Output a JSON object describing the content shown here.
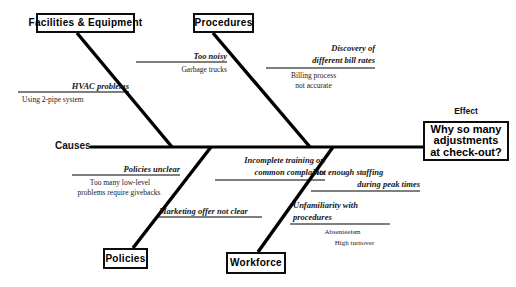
{
  "diagram": {
    "type": "fishbone-ishikawa",
    "causes_label": "Causes",
    "effect_label": "Effect",
    "effect": {
      "text": "Why so many adjustments at check-out?",
      "line1": "Why so many",
      "line2": "adjustments",
      "line3": "at check-out?"
    },
    "spine_color": "#000000",
    "background_color": "#ffffff",
    "categories": [
      {
        "id": "facilities",
        "label": "Facilities  &  Equipment",
        "position": "top-left",
        "causes": [
          {
            "label": "Too noisy",
            "sub_causes": [
              "Garbage trucks"
            ]
          },
          {
            "label": "HVAC problems",
            "sub_causes": [
              "Using 2-pipe system"
            ]
          }
        ]
      },
      {
        "id": "procedures",
        "label": "Procedures",
        "position": "top-middle",
        "causes": [
          {
            "label": "Discovery of different bill rates",
            "label_line1": "Discovery of",
            "label_line2": "different bill rates",
            "sub_causes": [
              "Billing process",
              "not accurate"
            ]
          }
        ]
      },
      {
        "id": "policies",
        "label": "Policies",
        "position": "bottom-left",
        "causes": [
          {
            "label": "Policies unclear",
            "sub_causes": [
              "Too many low-level",
              "problems require givebacks"
            ]
          },
          {
            "label": "Marketing offer not clear",
            "sub_causes": []
          }
        ]
      },
      {
        "id": "workforce",
        "label": "Workforce",
        "position": "bottom-middle",
        "causes": [
          {
            "label": "Incomplete training on common complaints",
            "label_line1": "Incomplete training on",
            "label_line2": "common complaints",
            "sub_causes": []
          },
          {
            "label": "Not enough staffing during peak times",
            "label_line1": "Not enough staffing",
            "label_line2": "during peak times",
            "sub_causes": []
          },
          {
            "label": "Unfamiliarity with procedures",
            "label_line1": "Unfamiliarity with",
            "label_line2": "procedures",
            "sub_causes": [
              "Absenteeism",
              "High turnover"
            ]
          }
        ]
      }
    ]
  }
}
